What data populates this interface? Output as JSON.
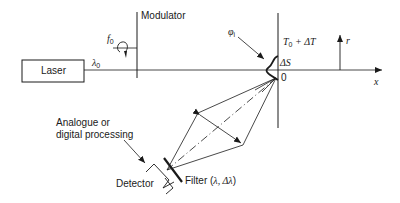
{
  "diagram": {
    "components": {
      "laser": "Laser",
      "modulator": "Modulator",
      "detector": "Detector",
      "processing_line1": "Analogue or",
      "processing_line2": "digital processing",
      "filter_prefix": "Filter (",
      "filter_params": "λ, Δλ",
      "filter_suffix": ")"
    },
    "symbols": {
      "wavelength": "λ",
      "wavelength_sub": "0",
      "frequency": "f",
      "frequency_sub": "0",
      "angle": "φ",
      "angle_sub": "i",
      "temperature_T": "T",
      "temperature_sub": "0",
      "temperature_rest": " + ΔT",
      "delta_s": "ΔS",
      "origin": "0",
      "axis_r": "r",
      "axis_x": "x"
    },
    "colors": {
      "line": "#1a1a1a",
      "background": "#ffffff"
    }
  }
}
